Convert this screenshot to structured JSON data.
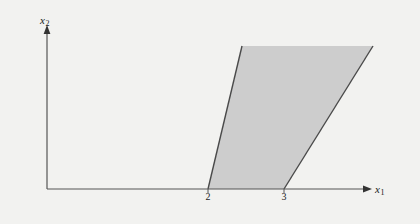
{
  "figure": {
    "name": "linear-inequality-feasible-region",
    "background_color": "#f2f2f0"
  },
  "axes": {
    "x": {
      "label": "x",
      "label_sub": "1",
      "name": "x1-axis",
      "arrow": "right-arrowhead",
      "origin_px": [
        47,
        189
      ],
      "end_px": [
        368,
        189
      ]
    },
    "y": {
      "label": "x",
      "label_sub": "2",
      "name": "x2-axis",
      "arrow": "up-arrowhead",
      "origin_px": [
        47,
        189
      ],
      "end_px": [
        47,
        28
      ]
    },
    "axis_color": "#555555"
  },
  "ticks": [
    {
      "label": "2",
      "x_px": 208
    },
    {
      "label": "3",
      "x_px": 284
    }
  ],
  "chart_data": {
    "type": "area",
    "title": "",
    "xlabel": "x1",
    "ylabel": "x2",
    "grid": false,
    "legend": null,
    "shaded_region": {
      "name": "feasible-region",
      "fill_color": "#cdcdcd",
      "edge_color": "#4a4a4a",
      "description": "Region between two lines rising to the right from x=2 and x=3 on the x1 axis, clipped at the top of the plot",
      "vertices_px": [
        [
          208,
          189
        ],
        [
          242,
          46
        ],
        [
          373,
          46
        ],
        [
          284,
          189
        ]
      ]
    },
    "boundary_lines": [
      {
        "name": "left-boundary-line",
        "from_px": [
          208,
          189
        ],
        "to_px": [
          242,
          46
        ],
        "x_intercept": 2,
        "stroke": "#4a4a4a"
      },
      {
        "name": "right-boundary-line",
        "from_px": [
          284,
          189
        ],
        "to_px": [
          373,
          46
        ],
        "x_intercept": 3,
        "stroke": "#4a4a4a"
      }
    ]
  }
}
